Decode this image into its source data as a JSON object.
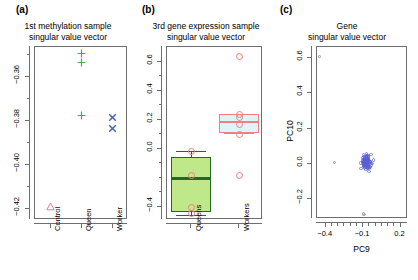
{
  "figure": {
    "width": 418,
    "height": 280,
    "background": "#ffffff"
  },
  "panels": [
    {
      "tag": "(a)",
      "title_line1": "1st methylation sample",
      "title_line2": "singular value vector"
    },
    {
      "tag": "(b)",
      "title_line1": "3rd gene expression sample",
      "title_line2": "singular value vector"
    },
    {
      "tag": "(c)",
      "title_line1": "Gene",
      "title_line2": "singular value vector"
    }
  ],
  "colors": {
    "control_red": "#F08080",
    "queen_green": "#3CB043",
    "worker_blue": "#3B5BC4",
    "box_green_fill": "#BFE88A",
    "box_green_border": "#1F6B1F",
    "box_cyan_fill": "#DFF5F5",
    "box_red_border": "#F08080",
    "scatter_blue": "#5A5FD0",
    "scatter_gray": "#9A9A9A",
    "axis_gray": "#6E6E6E",
    "text_black": "#000000"
  },
  "chart_data": [
    {
      "id": "panel-a",
      "type": "scatter",
      "title": "1st methylation sample singular value vector",
      "xlabel": "",
      "ylabel": "",
      "categories": [
        "Control",
        "Queen",
        "Worker"
      ],
      "xtick_labels": [
        "Control",
        "Queen",
        "Worker"
      ],
      "ytick_labels": [
        "-0.36",
        "-0.38",
        "-0.40",
        "-0.42"
      ],
      "ytick_values": [
        -0.36,
        -0.38,
        -0.4,
        -0.42
      ],
      "yminor_values": [
        -0.35,
        -0.37,
        -0.39,
        -0.41
      ],
      "ylim": [
        -0.425,
        -0.3465
      ],
      "grid": false,
      "legend": "none",
      "series": [
        {
          "name": "Control",
          "marker": "triangle",
          "color": "#F08080",
          "points": [
            {
              "x": "Control",
              "y": -0.4187
            }
          ]
        },
        {
          "name": "Queen",
          "marker": "plus",
          "color": "#3CB043",
          "points": [
            {
              "x": "Queen",
              "y": -0.3496
            },
            {
              "x": "Queen",
              "y": -0.3537
            },
            {
              "x": "Queen",
              "y": -0.3774
            }
          ]
        },
        {
          "name": "Worker",
          "marker": "cross",
          "color": "#3B5BC4",
          "points": [
            {
              "x": "Worker",
              "y": -0.3783
            },
            {
              "x": "Worker",
              "y": -0.3833
            }
          ]
        }
      ]
    },
    {
      "id": "panel-b",
      "type": "boxplot",
      "title": "3rd gene expression sample singular value vector",
      "xlabel": "",
      "ylabel": "",
      "categories": [
        "Queens",
        "Workers"
      ],
      "xtick_labels": [
        "Queens",
        "Workers"
      ],
      "ytick_labels": [
        "0.6",
        "0.4",
        "0.2",
        "0.0",
        "-0.4"
      ],
      "ytick_values": [
        0.6,
        0.4,
        0.2,
        0.0,
        -0.4
      ],
      "yminor_values": [
        0.5,
        0.3,
        0.1,
        -0.1,
        -0.2,
        -0.3
      ],
      "ylim": [
        -0.49,
        0.7
      ],
      "grid": false,
      "legend": "none",
      "boxes": [
        {
          "name": "Queens",
          "fill": "#BFE88A",
          "border": "#1F6B1F",
          "q1": -0.435,
          "median": -0.205,
          "q3": -0.055,
          "whisker_low": -0.455,
          "whisker_high": -0.018,
          "points": [
            -0.018,
            -0.185,
            -0.405,
            -0.445
          ]
        },
        {
          "name": "Workers",
          "fill": "#DFF5F5",
          "border": "#F08080",
          "q1": 0.108,
          "median": 0.183,
          "q3": 0.238,
          "whisker_low": 0.108,
          "whisker_high": 0.238,
          "points": [
            0.638,
            0.238,
            0.215,
            0.168,
            0.098,
            -0.185
          ]
        }
      ]
    },
    {
      "id": "panel-c",
      "type": "scatter",
      "title": "Gene singular value vector",
      "xlabel": "PC9",
      "ylabel": "PC10",
      "xtick_labels": [
        "-0.4",
        "-0.1",
        "0.2"
      ],
      "xtick_values": [
        -0.4,
        -0.1,
        0.2
      ],
      "xminor_values": [
        -0.35,
        -0.3,
        -0.25,
        -0.2,
        -0.15,
        -0.05,
        0.0,
        0.05,
        0.1,
        0.15
      ],
      "ytick_labels": [
        "0.6",
        "0.4",
        "0.2",
        "0.0",
        "-0.2"
      ],
      "ytick_values": [
        0.6,
        0.4,
        0.2,
        0.0,
        -0.2
      ],
      "xlim": [
        -0.47,
        0.26
      ],
      "ylim": [
        -0.31,
        0.66
      ],
      "grid": false,
      "legend": "none",
      "marker": "open-circle",
      "color": "#5A5FD0",
      "outlier_color": "#9A9A9A",
      "n_points": 118,
      "outliers": [
        {
          "x": -0.452,
          "y": 0.605
        },
        {
          "x": -0.328,
          "y": 0.008
        },
        {
          "x": -0.098,
          "y": -0.282
        },
        {
          "x": -0.092,
          "y": -0.285
        }
      ],
      "cluster": {
        "center_x": -0.072,
        "center_y": 0.012,
        "spread_x": 0.035,
        "spread_y": 0.032,
        "description": "dense cluster of small blue open circles near PC9 = -0.07, PC10 = 0.01"
      }
    }
  ]
}
